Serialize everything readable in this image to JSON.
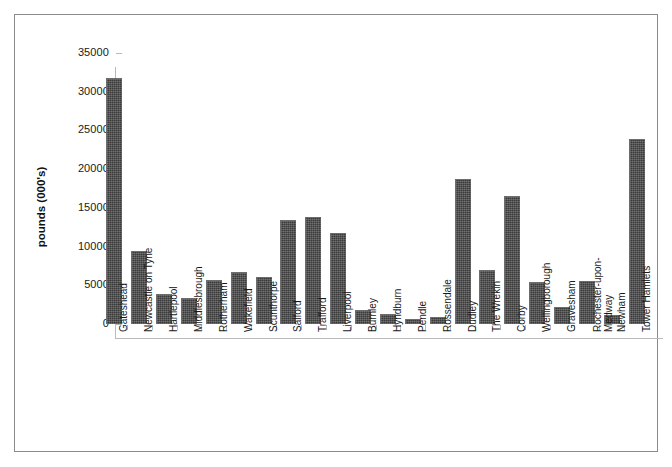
{
  "chart_data": {
    "type": "bar",
    "title": "",
    "xlabel": "",
    "ylabel": "pounds (000's)",
    "ylim": [
      0,
      35000
    ],
    "ytick_labels": [
      "35000",
      "30000",
      "25000",
      "20000",
      "15000",
      "10000",
      "5000",
      "0"
    ],
    "ytick_values": [
      35000,
      30000,
      25000,
      20000,
      15000,
      10000,
      5000,
      0
    ],
    "grid": false,
    "legend": false,
    "bar_color": "#3a3a3a",
    "categories": [
      "Gateshead",
      "Newcastle on Tyne",
      "Hartlepool",
      "Middlesbrough",
      "Rotherham",
      "Wakefield",
      "Scunthorpe",
      "Salford",
      "Trafford",
      "Liverpool",
      "Burnley",
      "Hyndburn",
      "Pendle",
      "Rossendale",
      "Dudley",
      "The Wrekin",
      "Corby",
      "Wellingborough",
      "Gravesham",
      "Rochester-upon-\nMedway",
      "Newham",
      "Tower Hamlets"
    ],
    "values": [
      31800,
      9400,
      3900,
      3300,
      5700,
      6700,
      6100,
      13400,
      13800,
      11700,
      1800,
      1300,
      700,
      900,
      18700,
      7000,
      16500,
      5400,
      2200,
      5500,
      1200,
      23900
    ]
  }
}
